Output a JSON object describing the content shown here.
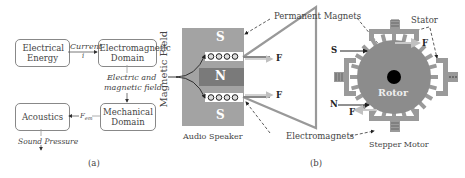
{
  "panel_a": {
    "caption": "(a)",
    "boxes": {
      "electrical": "Electrical Energy",
      "electromagnetic": "Electromagnetic Domain",
      "mechanical": "Mechanical Domain",
      "acoustics": "Acoustics"
    },
    "edges": {
      "current_label": "Current",
      "current_symbol": "i",
      "field_label_1": "Electric and",
      "field_label_2": "magnetic field",
      "force_label": "F",
      "force_sub": "em",
      "sound_label": "Sound Pressure"
    }
  },
  "panel_b": {
    "caption": "(b)",
    "speaker": {
      "title": "Audio Speaker",
      "side_label": "Magnetic Field",
      "pole_top": "S",
      "pole_mid": "N",
      "pole_bottom": "S",
      "force_top": "F",
      "force_bottom": "F"
    },
    "callouts": {
      "permanent_magnets": "Permanent Magnets",
      "electromagnets": "Electromagnets",
      "stator": "Stator"
    },
    "motor": {
      "title": "Stepper Motor",
      "rotor": "Rotor",
      "pole_s": "S",
      "pole_n": "N",
      "force_top": "F",
      "force_bottom": "F"
    },
    "colors": {
      "magnet": "#a0a0a0",
      "dark_magnet": "#7c7c7c",
      "rotor": "#8a8a8a",
      "stator": "#9a9a9a",
      "light_arrow": "#c8c8c8"
    }
  }
}
